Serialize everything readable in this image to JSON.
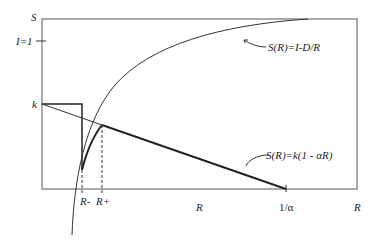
{
  "axes": {
    "y_label": "S",
    "x_label": "R",
    "y_tick_top": "I=1",
    "y_tick_k": "k",
    "x_tick_R": "R",
    "x_tick_inv_alpha": "1/α",
    "x_tick_Rminus": "R-",
    "x_tick_Rplus": "R+"
  },
  "annotations": {
    "curve_formula": "S(R)=I-D/R",
    "line_formula": "S(R)=k(1 - αR)"
  },
  "colors": {
    "line": "#222222",
    "frame": "#555555"
  }
}
